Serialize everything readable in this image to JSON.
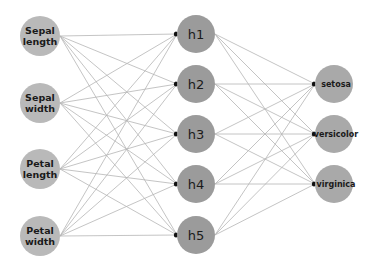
{
  "diagram": {
    "type": "neural-network",
    "colors": {
      "input_fill": "#b9b9b9",
      "hidden_fill": "#9b9b9b",
      "output_fill": "#a9a9a9",
      "edge": "#b5b5b5",
      "arrowhead": "#111111",
      "text": "#1a1a1a"
    },
    "layers": {
      "input": [
        {
          "id": "sepal-length",
          "line1": "Sepal",
          "line2": "length",
          "cx": 40,
          "cy": 36,
          "r": 20
        },
        {
          "id": "sepal-width",
          "line1": "Sepal",
          "line2": "width",
          "cx": 40,
          "cy": 103,
          "r": 20
        },
        {
          "id": "petal-length",
          "line1": "Petal",
          "line2": "length",
          "cx": 40,
          "cy": 169,
          "r": 20
        },
        {
          "id": "petal-width",
          "line1": "Petal",
          "line2": "width",
          "cx": 40,
          "cy": 236,
          "r": 20
        }
      ],
      "hidden": [
        {
          "id": "h1",
          "label": "h1",
          "cx": 196,
          "cy": 34,
          "r": 19
        },
        {
          "id": "h2",
          "label": "h2",
          "cx": 196,
          "cy": 84,
          "r": 19
        },
        {
          "id": "h3",
          "label": "h3",
          "cx": 196,
          "cy": 134,
          "r": 19
        },
        {
          "id": "h4",
          "label": "h4",
          "cx": 196,
          "cy": 184,
          "r": 19
        },
        {
          "id": "h5",
          "label": "h5",
          "cx": 196,
          "cy": 235,
          "r": 19
        }
      ],
      "output": [
        {
          "id": "setosa",
          "label": "setosa",
          "cx": 334,
          "cy": 84,
          "r": 19
        },
        {
          "id": "versicolor",
          "label": "versicolor",
          "cx": 334,
          "cy": 134,
          "r": 19
        },
        {
          "id": "virginica",
          "label": "virginica",
          "cx": 334,
          "cy": 184,
          "r": 19
        }
      ]
    },
    "connectivity": "fully-connected"
  }
}
